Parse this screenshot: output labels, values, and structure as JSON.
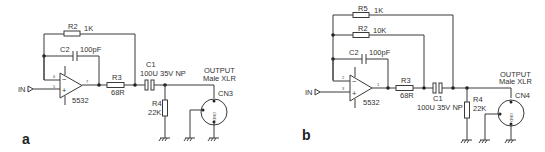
{
  "figure": {
    "panels": [
      {
        "id": "a",
        "label": "a",
        "input_label": "IN",
        "opamp": {
          "ref": "5532",
          "pin_minus": "6",
          "pin_plus": "5",
          "pin_out": "7"
        },
        "r2": {
          "ref": "R2",
          "value": "1K"
        },
        "c2": {
          "ref": "C2",
          "value": "100pF"
        },
        "r3": {
          "ref": "R3",
          "value": "68R"
        },
        "c1": {
          "ref": "C1",
          "value": "100U 35V NP"
        },
        "r4": {
          "ref": "R4",
          "value": "22K"
        },
        "connector": {
          "ref": "CN3",
          "title": "OUTPUT",
          "subtitle": "Male XLR",
          "pin_label": "GND"
        }
      },
      {
        "id": "b",
        "label": "b",
        "input_label": "IN",
        "opamp": {
          "ref": "5532",
          "pin_minus": "2",
          "pin_plus": "3",
          "pin_out": "1"
        },
        "r5": {
          "ref": "R5",
          "value": "1K"
        },
        "r2": {
          "ref": "R2",
          "value": "10K"
        },
        "c2": {
          "ref": "C2",
          "value": "100pF"
        },
        "r3": {
          "ref": "R3",
          "value": "68R"
        },
        "c1": {
          "ref": "C1",
          "value": "100U 35V NP"
        },
        "r4": {
          "ref": "R4",
          "value": "22K"
        },
        "connector": {
          "ref": "CN4",
          "title": "OUTPUT",
          "subtitle": "Male XLR",
          "pin_label": "GND"
        }
      }
    ]
  }
}
